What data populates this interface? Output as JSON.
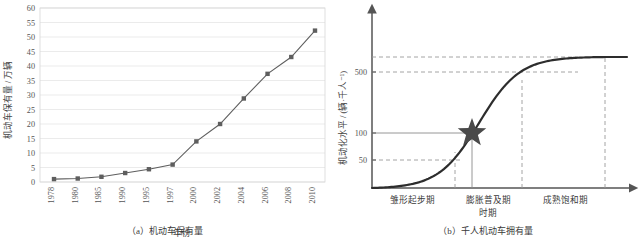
{
  "figure": {
    "panel_a_caption": "（a）机动车保有量",
    "panel_b_caption": "（b）千人机动车拥有量"
  },
  "chart_data": [
    {
      "id": "panel-a",
      "type": "line",
      "title": "（a）机动车保有量",
      "xlabel": "年份",
      "ylabel": "机动车保有量 / 万辆",
      "categories": [
        "1978",
        "1980",
        "1985",
        "1990",
        "1995",
        "1997",
        "2000",
        "2002",
        "2004",
        "2006",
        "2008",
        "2010"
      ],
      "values": [
        1.0,
        1.2,
        1.8,
        3.1,
        4.4,
        6.0,
        14.0,
        20.0,
        28.8,
        37.3,
        43.1,
        52.2
      ],
      "ylim": [
        0,
        60
      ],
      "yticks": [
        0,
        5,
        10,
        15,
        20,
        25,
        30,
        35,
        40,
        45,
        50,
        55,
        60
      ],
      "grid": true,
      "legend": "none",
      "marker": "square",
      "series_color": "#5e5e5e"
    },
    {
      "id": "panel-b",
      "type": "line",
      "title": "（b）千人机动车拥有量",
      "xlabel": "时期",
      "ylabel": "机动化水平 / (辆·千人⁻¹)",
      "yticks": [
        50,
        100,
        500
      ],
      "saturation_value": 600,
      "grid": false,
      "legend": "none",
      "curve_shape": "logistic-s-curve",
      "annotations": [
        {
          "name": "current-position-star",
          "symbol": "★",
          "y_value": 95,
          "phase": "膨胀普及期"
        }
      ],
      "phases": [
        {
          "label": "雏形起步期"
        },
        {
          "label": "膨胀普及期"
        },
        {
          "label": "成熟饱和期"
        }
      ],
      "guide_lines": [
        {
          "kind": "dashed",
          "orientation": "horizontal",
          "value": 600
        },
        {
          "kind": "dashed",
          "orientation": "horizontal",
          "value": 500
        },
        {
          "kind": "dashed",
          "orientation": "horizontal",
          "value": 50
        },
        {
          "kind": "solid",
          "orientation": "horizontal",
          "value": 95
        },
        {
          "kind": "dashed",
          "orientation": "vertical",
          "label": "phase-1-end"
        },
        {
          "kind": "solid",
          "orientation": "vertical",
          "label": "star-marker"
        },
        {
          "kind": "dashed",
          "orientation": "vertical",
          "label": "phase-2-end"
        },
        {
          "kind": "dashed",
          "orientation": "vertical",
          "label": "saturation-end"
        }
      ]
    }
  ],
  "colors": {
    "series": "#5e5e5e",
    "grid": "#e3e3e3",
    "axis": "#7a7a7a",
    "text": "#3a3a3a",
    "star": "#4a4a4a",
    "dashed": "#9a9a9a"
  }
}
